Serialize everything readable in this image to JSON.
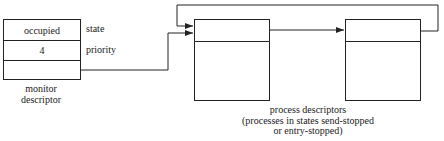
{
  "monitor": {
    "fields": [
      {
        "value": "occupied",
        "label": "state"
      },
      {
        "value": "4",
        "label": "priority"
      },
      {
        "value": "",
        "label": ""
      }
    ],
    "caption_line1": "monitor",
    "caption_line2": "descriptor"
  },
  "process_descriptors": {
    "count": 2,
    "caption_line1": "process descriptors",
    "caption_line2": "(processes in states send-stopped",
    "caption_line3": "or entry-stopped)"
  },
  "colors": {
    "line": "#222222",
    "background": "#ffffff"
  }
}
